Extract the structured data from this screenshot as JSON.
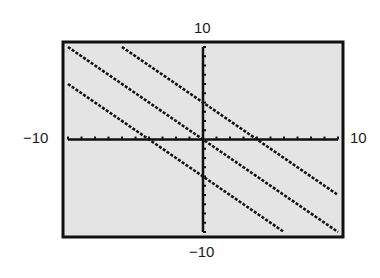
{
  "chart_data": {
    "type": "line",
    "title": "",
    "xlabel": "",
    "ylabel": "",
    "xlim": [
      -10,
      10
    ],
    "ylim": [
      -10,
      10
    ],
    "x_tick_step": 1,
    "y_tick_step": 1,
    "grid": false,
    "legend": null,
    "window_labels": {
      "ymax": "10",
      "ymin": "−10",
      "xmin": "−10",
      "xmax": "10"
    },
    "series": [
      {
        "name": "y = -x + 4",
        "slope": -1,
        "intercept": 4,
        "points": [
          [
            -6,
            10
          ],
          [
            10,
            -6
          ]
        ]
      },
      {
        "name": "y = -x",
        "slope": -1,
        "intercept": 0,
        "points": [
          [
            -10,
            10
          ],
          [
            10,
            -10
          ]
        ]
      },
      {
        "name": "y = -x - 4",
        "slope": -1,
        "intercept": -4,
        "points": [
          [
            -10,
            6
          ],
          [
            6,
            -10
          ]
        ]
      }
    ]
  },
  "style": {
    "screen_bg": "#e4e4e4",
    "frame_color": "#111111",
    "axis_color": "#111111",
    "line_color": "#111111"
  }
}
